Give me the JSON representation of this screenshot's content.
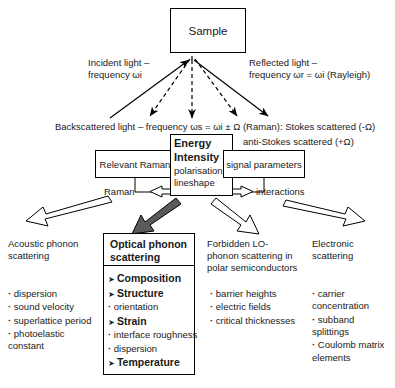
{
  "diagram": {
    "sample_box": "Sample",
    "incident_label": "Incident light –\nfrequency ωi",
    "reflected_label": "Reflected light –\nfrequency ωr = ωi (Rayleigh)",
    "backscattered_label": "Backscattered light – frequency ωs =  ωi ± Ω  (Raman): Stokes scattered (-Ω)",
    "antistokes_label": "anti-Stokes scattered (+Ω)",
    "left_box": "Relevant Raman",
    "right_box": "signal parameters",
    "center_box": {
      "line1": "Energy",
      "line2": "Intensity",
      "line3": "polarisation",
      "line4": "lineshape"
    },
    "raman_label": "Raman",
    "interactions_label": "interactions"
  },
  "columns": [
    {
      "title": "Acoustic phonon\nscattering",
      "boxed": false,
      "items": [
        {
          "text": "dispersion",
          "bold": false,
          "marker": "dot"
        },
        {
          "text": "sound velocity",
          "bold": false,
          "marker": "dot"
        },
        {
          "text": "superlattice period",
          "bold": false,
          "marker": "dot"
        },
        {
          "text": "photoelastic\nconstant",
          "bold": false,
          "marker": "dot"
        }
      ]
    },
    {
      "title": "Optical phonon\nscattering",
      "boxed": true,
      "title_bold": true,
      "items": [
        {
          "text": "Composition",
          "bold": true,
          "marker": "arrow"
        },
        {
          "text": "Structure",
          "bold": true,
          "marker": "arrow"
        },
        {
          "text": "orientation",
          "bold": false,
          "marker": "dot"
        },
        {
          "text": "Strain",
          "bold": true,
          "marker": "arrow"
        },
        {
          "text": "interface roughness",
          "bold": false,
          "marker": "dot"
        },
        {
          "text": "dispersion",
          "bold": false,
          "marker": "dot"
        },
        {
          "text": "Temperature",
          "bold": true,
          "marker": "arrow"
        }
      ]
    },
    {
      "title": "Forbidden LO-\nphonon scattering in\npolar semiconductors",
      "boxed": false,
      "items": [
        {
          "text": "barrier heights",
          "bold": false,
          "marker": "dot"
        },
        {
          "text": "electric fields",
          "bold": false,
          "marker": "dot"
        },
        {
          "text": "critical thicknesses",
          "bold": false,
          "marker": "dot"
        }
      ]
    },
    {
      "title": "Electronic\nscattering",
      "boxed": false,
      "items": [
        {
          "text": "carrier\nconcentration",
          "bold": false,
          "marker": "dot"
        },
        {
          "text": "subband\nsplittings",
          "bold": false,
          "marker": "dot"
        },
        {
          "text": "Coulomb matrix\nelements",
          "bold": false,
          "marker": "dot"
        }
      ]
    }
  ],
  "colors": {
    "stroke": "#000000",
    "background": "#ffffff",
    "highlight_arrow_fill": "#5a5a5a"
  }
}
